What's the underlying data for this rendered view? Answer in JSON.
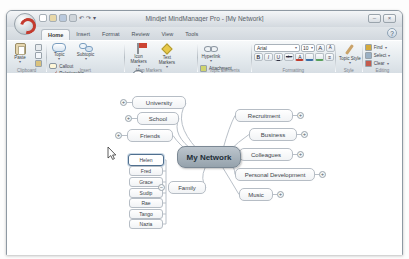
{
  "window": {
    "title": "Mindjet MindManager Pro - [My Network]",
    "minimize_glyph": "–",
    "close_glyph": "×",
    "help_glyph": "?"
  },
  "icons": {
    "dropdown": "▾",
    "plus": "+",
    "minus": "−",
    "undo": "↶",
    "redo": "↷"
  },
  "tabs": {
    "items": [
      "Home",
      "Insert",
      "Format",
      "Review",
      "View",
      "Tools"
    ],
    "active": "Home"
  },
  "ribbon": {
    "clipboard": {
      "label": "Clipboard",
      "paste": "Paste"
    },
    "insert": {
      "label": "Insert",
      "topic": "Topic",
      "subtopic": "Subtopic",
      "callout": "Callout",
      "relationship": "Relationship",
      "boundary": "Boundary"
    },
    "map_markers": {
      "label": "Map Markers",
      "icon_markers": "Icon Markers",
      "text_markers": "Text Markers",
      "task_info": "Task Info"
    },
    "topic_elements": {
      "label": "Topic Elements",
      "hyperlink": "Hyperlink",
      "attachment": "Attachment",
      "notes": "Notes",
      "image": "Image"
    },
    "formatting": {
      "label": "Formatting",
      "font": "Arial",
      "size": "10",
      "grow": "A",
      "shrink": "A",
      "bold": "B",
      "italic": "I",
      "underline": "U",
      "strike": "abc",
      "font_color": "A"
    },
    "style": {
      "label": "Style",
      "topic_style": "Topic Style"
    },
    "editing": {
      "label": "Editing",
      "find": "Find",
      "select": "Select",
      "clear": "Clear"
    }
  },
  "map": {
    "center_label": "My Network",
    "topics": {
      "university": {
        "label": "University"
      },
      "school": {
        "label": "School"
      },
      "friends": {
        "label": "Friends"
      },
      "recruitment": {
        "label": "Recruitment"
      },
      "business": {
        "label": "Business"
      },
      "colleagues": {
        "label": "Colleagues"
      },
      "personal_development": {
        "label": "Personal Development"
      },
      "music": {
        "label": "Music"
      },
      "family": {
        "label": "Family"
      }
    },
    "family_subtopics": [
      "Helen",
      "Fred",
      "Grace",
      "Sudip",
      "Rae",
      "Tango",
      "Nazia"
    ],
    "selected_topic": "Helen"
  }
}
